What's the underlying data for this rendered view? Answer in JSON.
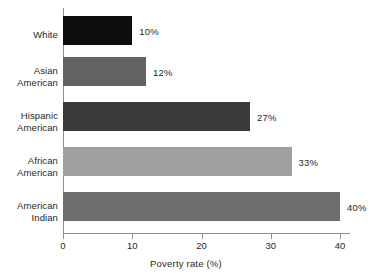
{
  "chart_data": {
    "type": "bar",
    "orientation": "horizontal",
    "title": "",
    "xlabel": "Poverty rate (%)",
    "ylabel": "",
    "categories": [
      "White",
      "Asian American",
      "Hispanic American",
      "African American",
      "American Indian"
    ],
    "category_lines": [
      [
        "White"
      ],
      [
        "Asian",
        "American"
      ],
      [
        "Hispanic",
        "American"
      ],
      [
        "African",
        "American"
      ],
      [
        "American",
        "Indian"
      ]
    ],
    "values": [
      10,
      12,
      27,
      33,
      40
    ],
    "value_labels": [
      "10%",
      "12%",
      "27%",
      "33%",
      "40%"
    ],
    "bar_colors": [
      "#0d0d0d",
      "#636363",
      "#3a3a3a",
      "#a0a0a0",
      "#6e6e6e"
    ],
    "xlim": [
      0,
      40
    ],
    "xticks": [
      0,
      10,
      20,
      30,
      40
    ],
    "xtick_labels": [
      "0",
      "10",
      "20",
      "30",
      "40"
    ],
    "grid": false,
    "legend": false,
    "axis_color": "#8e8e8e",
    "text_color": "#1f1f1f",
    "background": "#ffffff"
  }
}
